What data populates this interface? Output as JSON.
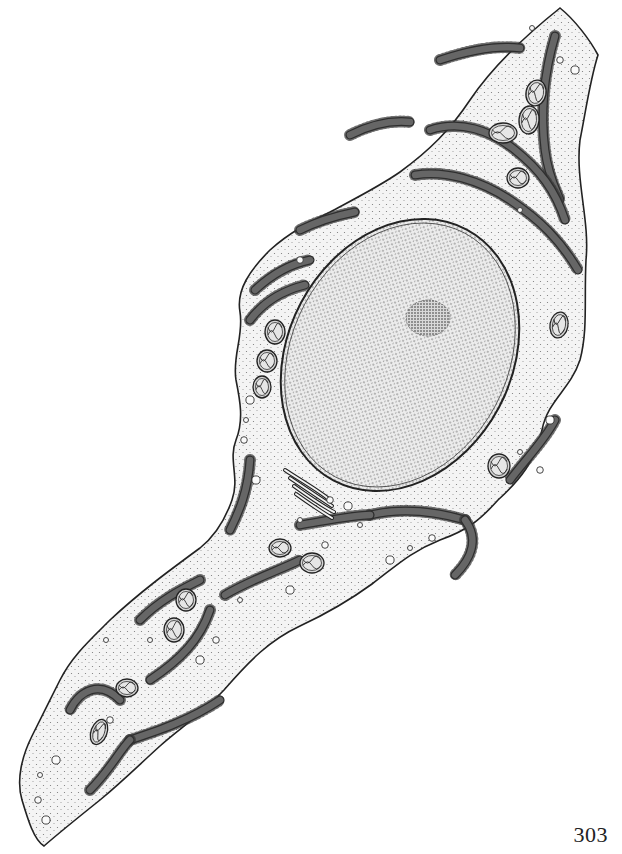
{
  "page": {
    "number": "303",
    "background": "#ffffff",
    "ink": "#222222",
    "cytoplasm_fill": "#efefef",
    "er_fill": "#e2e2e2",
    "nucleus_fill": "#e8e8e8"
  },
  "illustration": {
    "subject": "fibroblast cell line drawing",
    "cell_outline": "M 560 8 C 575 20 590 40 598 55 C 590 80 586 110 580 140 C 575 180 590 220 586 260 C 584 300 588 330 580 360 C 570 390 548 400 542 430 C 536 460 520 480 498 500 C 480 520 468 530 440 540 C 410 552 396 566 372 584 C 350 600 330 612 300 626 C 270 640 250 660 224 690 C 200 716 180 728 160 746 C 140 764 124 780 100 800 C 80 816 60 832 44 846 C 34 840 28 820 22 800 C 16 780 22 756 32 736 C 44 712 50 700 60 680 C 72 656 90 640 110 620 C 140 592 170 570 200 548 C 215 536 225 520 232 500 C 240 478 228 460 236 440 C 244 420 240 400 236 380 C 232 356 244 336 240 312 C 236 290 250 270 270 250 C 290 232 310 222 330 212 C 360 196 380 186 400 172 C 430 150 450 130 470 100 C 490 70 520 40 560 8 Z",
    "nucleus": {
      "cx": 400,
      "cy": 355,
      "rx": 112,
      "ry": 142,
      "rotate": 28
    },
    "nucleolus": {
      "cx": 428,
      "cy": 318,
      "rx": 22,
      "ry": 18
    },
    "mitochondria": [
      {
        "cx": 536,
        "cy": 93,
        "rx": 10,
        "ry": 13,
        "rotate": 10
      },
      {
        "cx": 529,
        "cy": 120,
        "rx": 10,
        "ry": 14,
        "rotate": 5
      },
      {
        "cx": 503,
        "cy": 133,
        "rx": 14,
        "ry": 10,
        "rotate": 0
      },
      {
        "cx": 518,
        "cy": 178,
        "rx": 11,
        "ry": 10,
        "rotate": 0
      },
      {
        "cx": 275,
        "cy": 332,
        "rx": 10,
        "ry": 12,
        "rotate": 0
      },
      {
        "cx": 267,
        "cy": 361,
        "rx": 10,
        "ry": 11,
        "rotate": 0
      },
      {
        "cx": 262,
        "cy": 387,
        "rx": 9,
        "ry": 11,
        "rotate": 0
      },
      {
        "cx": 559,
        "cy": 325,
        "rx": 9,
        "ry": 13,
        "rotate": 10
      },
      {
        "cx": 499,
        "cy": 466,
        "rx": 11,
        "ry": 12,
        "rotate": 0
      },
      {
        "cx": 280,
        "cy": 548,
        "rx": 11,
        "ry": 9,
        "rotate": 0
      },
      {
        "cx": 312,
        "cy": 563,
        "rx": 12,
        "ry": 10,
        "rotate": 0
      },
      {
        "cx": 186,
        "cy": 600,
        "rx": 10,
        "ry": 11,
        "rotate": 0
      },
      {
        "cx": 174,
        "cy": 630,
        "rx": 10,
        "ry": 12,
        "rotate": 0
      },
      {
        "cx": 127,
        "cy": 688,
        "rx": 11,
        "ry": 9,
        "rotate": 0
      },
      {
        "cx": 99,
        "cy": 732,
        "rx": 8,
        "ry": 13,
        "rotate": 20
      }
    ],
    "rough_er": [
      "M 555 36 C 545 70 540 110 545 150 C 548 175 556 190 560 200",
      "M 440 60 C 470 50 495 45 520 48",
      "M 430 130 C 460 120 490 130 515 150 C 540 170 555 190 565 220",
      "M 415 175 C 445 170 480 180 510 200 C 540 220 560 240 578 270",
      "M 350 135 C 370 125 390 120 410 122",
      "M 300 230 C 320 220 340 215 355 212",
      "M 255 290 C 270 276 290 264 310 260",
      "M 250 320 C 265 300 285 290 305 285",
      "M 555 420 C 545 440 525 460 510 480",
      "M 250 460 C 248 490 240 510 230 530",
      "M 370 515 C 400 508 430 510 465 520",
      "M 465 520 C 480 540 470 560 455 575",
      "M 300 525 C 330 520 355 515 370 515",
      "M 225 595 C 250 580 280 570 300 560",
      "M 140 620 C 160 600 180 590 200 580",
      "M 120 700 C 100 680 80 690 70 710",
      "M 210 610 C 200 640 180 660 150 680",
      "M 130 740 C 160 730 190 720 220 700",
      "M 90 790 C 110 770 120 750 130 740"
    ],
    "golgi": [
      "M 285 470 C 300 480 318 490 330 500",
      "M 290 478 C 305 488 320 498 332 506",
      "M 294 486 C 308 496 322 506 334 512",
      "M 296 494 C 310 504 322 512 332 518"
    ],
    "vesicles": [
      [
        532,
        28
      ],
      [
        560,
        60
      ],
      [
        575,
        70
      ],
      [
        520,
        210
      ],
      [
        300,
        260
      ],
      [
        250,
        400
      ],
      [
        246,
        420
      ],
      [
        244,
        440
      ],
      [
        256,
        480
      ],
      [
        300,
        520
      ],
      [
        330,
        500
      ],
      [
        348,
        506
      ],
      [
        360,
        525
      ],
      [
        325,
        545
      ],
      [
        390,
        560
      ],
      [
        410,
        548
      ],
      [
        432,
        538
      ],
      [
        290,
        590
      ],
      [
        240,
        600
      ],
      [
        216,
        640
      ],
      [
        200,
        660
      ],
      [
        150,
        640
      ],
      [
        110,
        720
      ],
      [
        56,
        760
      ],
      [
        40,
        775
      ],
      [
        38,
        800
      ],
      [
        46,
        820
      ],
      [
        520,
        452
      ],
      [
        540,
        470
      ],
      [
        550,
        420
      ],
      [
        106,
        640
      ]
    ]
  }
}
